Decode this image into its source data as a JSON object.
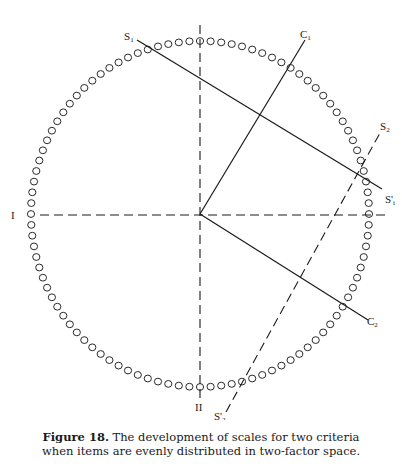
{
  "diagram": {
    "type": "factor-space scale diagram",
    "ring": {
      "center": [
        200,
        214
      ],
      "rx": 169,
      "ry": 173,
      "item_count": 100,
      "item_marker": "open-circle"
    },
    "axes": [
      {
        "id": "I",
        "label": "I",
        "orientation": "horizontal",
        "style": "dashed"
      },
      {
        "id": "II",
        "label": "II",
        "orientation": "vertical",
        "style": "dashed"
      }
    ],
    "vectors": [
      {
        "id": "C1",
        "label": "C",
        "sub": "1",
        "from": [
          200,
          214
        ],
        "to": [
          305,
          40
        ],
        "style": "solid"
      },
      {
        "id": "C2",
        "label": "C",
        "sub": "2",
        "from": [
          200,
          214
        ],
        "to": [
          368,
          320
        ],
        "style": "solid"
      }
    ],
    "scale_lines": [
      {
        "id": "S1",
        "label_start": "S",
        "sub_start": "1",
        "label_end": "S'",
        "sub_end": "1",
        "from": [
          137,
          40
        ],
        "to": [
          380,
          188
        ],
        "style": "solid"
      },
      {
        "id": "S2",
        "label_start": "S'",
        "sub_start": "2",
        "label_end": "S",
        "sub_end": "2",
        "from": [
          224,
          415
        ],
        "to": [
          380,
          132
        ],
        "style": "dashed"
      }
    ],
    "labels": {
      "S1": "S",
      "S1_sub": "1",
      "C1": "C",
      "C1_sub": "1",
      "S2": "S",
      "S2_sub": "2",
      "S1prime": "S'",
      "S1prime_sub": "i",
      "C2": "C",
      "C2_sub": "2",
      "I": "I",
      "II": "II",
      "S2prime": "S'",
      "S2prime_sub": "2"
    }
  },
  "caption": {
    "figure_label": "Figure 18.",
    "line1_rest": " The development of scales for two criteria",
    "line2": "when items are evenly distributed in two-factor space."
  }
}
